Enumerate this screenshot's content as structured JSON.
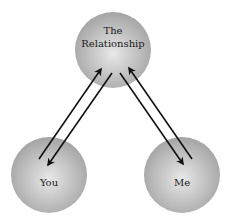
{
  "diagram": {
    "nodes": [
      {
        "id": "relationship",
        "label_lines": [
          "The",
          "Relationship"
        ]
      },
      {
        "id": "you",
        "label_lines": [
          "You"
        ]
      },
      {
        "id": "me",
        "label_lines": [
          "Me"
        ]
      }
    ],
    "edges": [
      {
        "from": "you",
        "to": "relationship"
      },
      {
        "from": "relationship",
        "to": "you"
      },
      {
        "from": "relationship",
        "to": "me"
      },
      {
        "from": "me",
        "to": "relationship"
      }
    ],
    "colors": {
      "node_center": "#e6e6e6",
      "node_edge": "#a6a6a6",
      "arrow": "#111111"
    }
  }
}
